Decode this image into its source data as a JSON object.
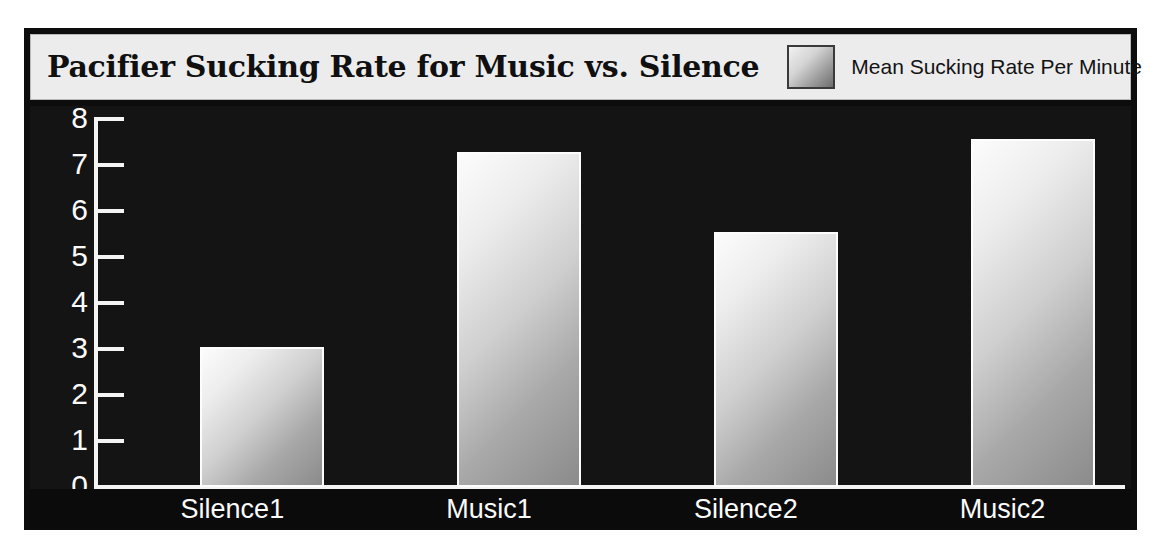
{
  "chart_data": {
    "type": "bar",
    "title": "Pacifier Sucking Rate for Music vs. Silence",
    "xlabel": "",
    "ylabel": "",
    "categories": [
      "Silence1",
      "Music1",
      "Silence2",
      "Music2"
    ],
    "values": [
      3.05,
      7.28,
      5.55,
      7.57
    ],
    "series": [
      {
        "name": "Mean Sucking Rate Per Minute",
        "values": [
          3.05,
          7.28,
          5.55,
          7.57
        ]
      }
    ],
    "ylim": [
      0,
      8
    ],
    "ytick_labels": [
      "8",
      "7",
      "6",
      "5",
      "4",
      "3",
      "2",
      "1",
      "0"
    ],
    "yticks": [
      8,
      7,
      6,
      5,
      4,
      3,
      2,
      1,
      0
    ],
    "grid": false,
    "legend": {
      "position": "top-right",
      "entries": [
        "Mean Sucking Rate Per Minute"
      ]
    }
  },
  "legend": {
    "label": "Mean Sucking Rate Per Minute"
  },
  "colors": {
    "plot_background": "#141414",
    "frame_background": "#0d0d0d",
    "header_background": "#ececed",
    "axis": "#f4f4f4",
    "tick_text": "#fbfbfb",
    "title_text": "#101010",
    "bar_light": "#fcfcfc",
    "bar_dark": "#8b8b8b",
    "bar_outline": "#fdfdfd"
  }
}
